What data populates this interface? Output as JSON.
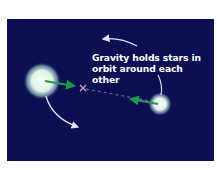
{
  "diagram": {
    "background_color": "#0c0f52",
    "caption": {
      "line1": "Gravity holds stars in",
      "line2": "orbit around each other"
    },
    "elements": {
      "star_large": {
        "label": "larger star",
        "color": "#e8f7ee"
      },
      "star_small": {
        "label": "smaller star",
        "color": "#e8f7ee"
      },
      "center_of_mass": {
        "label": "center of mass marker",
        "symbol": "×",
        "color": "#c8a6d8"
      },
      "gravity_arrows": {
        "color": "#1f9a4a"
      },
      "orbit_arrows": {
        "color": "#dfe3f5"
      }
    }
  }
}
